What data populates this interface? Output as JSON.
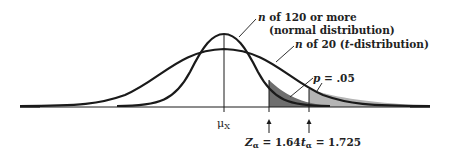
{
  "figure": {
    "labels": {
      "normal_n": "n",
      "normal_text": " of 120 or more",
      "normal_sub": "(normal distribution)",
      "t_n": "n",
      "t_text": " of 20 (",
      "t_t": "t",
      "t_text2": "-distribution)",
      "p_sym": "p",
      "p_val": " = .05",
      "mu": "μ",
      "mu_sub": "X",
      "z_sym": "Z",
      "z_sub": "α",
      "z_val": " = 1.64",
      "t_sym": "t",
      "t_sub": "α",
      "t_val": " = 1.725"
    },
    "colors": {
      "line": "#1a1a1a",
      "dark_shade": "#6e6e6e",
      "light_shade": "#b4b4b4"
    }
  }
}
